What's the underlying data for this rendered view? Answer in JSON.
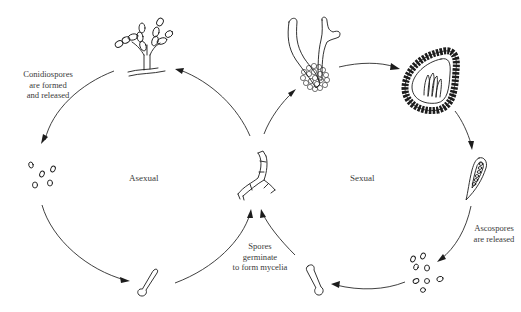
{
  "diagram": {
    "cycles": [
      {
        "name": "asexual",
        "label": "Asexual"
      },
      {
        "name": "sexual",
        "label": "Sexual"
      }
    ],
    "annotations": {
      "conidiospores": [
        "Conidiospores",
        "are formed",
        "and released"
      ],
      "germinate": [
        "Spores",
        "germinate",
        "to form mycelia"
      ],
      "ascospores": [
        "Ascospores",
        "are released"
      ]
    },
    "stages": {
      "asexual": [
        "conidiophore",
        "conidiospores",
        "germinating spore",
        "mycelium"
      ],
      "sexual": [
        "hyphae fusing",
        "ascocarp",
        "ascus",
        "ascospores",
        "germinating spore",
        "mycelium"
      ]
    },
    "colors": {
      "line": "#1c1c1c",
      "text": "#3a3a3a",
      "background": "#ffffff"
    }
  }
}
